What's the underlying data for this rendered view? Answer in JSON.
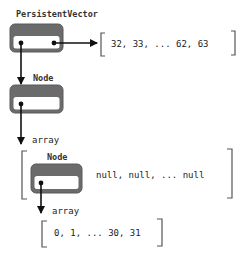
{
  "diagram": {
    "colors": {
      "box_border": "#5a5a5a",
      "box_header": "#6b6b6b",
      "box_body": "#ffffff",
      "arrow": "#111111",
      "bracket": "#555555",
      "text": "#222222"
    },
    "root": {
      "label": "PersistentVector",
      "tail_values": "32, 33, ... 62, 63"
    },
    "root_node": {
      "label": "Node",
      "array_label": "array"
    },
    "root_array": {
      "child_label": "Node",
      "rest_values": "null, null, ... null"
    },
    "leaf": {
      "array_label": "array",
      "values": "0, 1, ... 30, 31"
    }
  }
}
